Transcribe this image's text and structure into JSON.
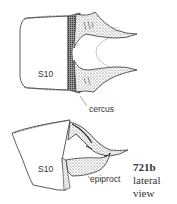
{
  "figure": {
    "number": "721b",
    "caption_lines": [
      "lateral",
      "view"
    ],
    "labels": {
      "top_segment": "S10",
      "bottom_segment": "S10",
      "cercus": "cercus",
      "epiproct": "epiproct"
    }
  },
  "colors": {
    "ink": "#333333",
    "shade": "#555555",
    "background": "#ffffff"
  }
}
